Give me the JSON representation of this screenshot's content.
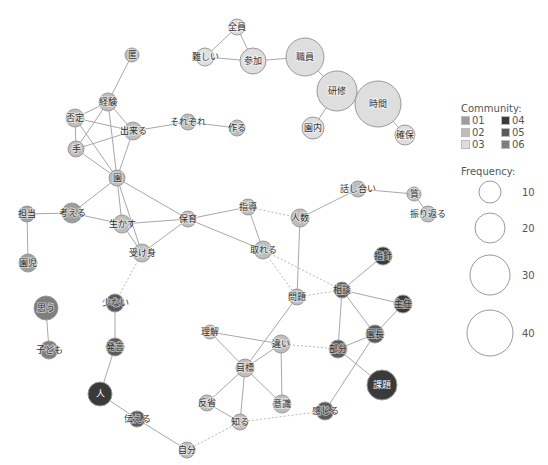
{
  "legend": {
    "community_title": "Community:",
    "communities": [
      {
        "id": "01",
        "color": "#9e9e9e"
      },
      {
        "id": "04",
        "color": "#3a3a3a"
      },
      {
        "id": "02",
        "color": "#bdbdbd"
      },
      {
        "id": "05",
        "color": "#5a5a5a"
      },
      {
        "id": "03",
        "color": "#dedede"
      },
      {
        "id": "06",
        "color": "#7e7e7e"
      }
    ],
    "frequency_title": "Frequency:",
    "frequencies": [
      {
        "label": "10",
        "r": 11,
        "cy": 192
      },
      {
        "label": "20",
        "r": 15,
        "cy": 228
      },
      {
        "label": "30",
        "r": 20,
        "cy": 275
      },
      {
        "label": "40",
        "r": 23,
        "cy": 333
      }
    ]
  },
  "community_colors": {
    "01": "#9e9e9e",
    "02": "#bdbdbd",
    "03": "#dedede",
    "04": "#3a3a3a",
    "05": "#5a5a5a",
    "06": "#7e7e7e"
  },
  "nodes": [
    {
      "id": "zenin",
      "label": "全員",
      "x": 237,
      "y": 27,
      "r": 8,
      "c": "03"
    },
    {
      "id": "muzukashii",
      "label": "難しい",
      "x": 205,
      "y": 57,
      "r": 9,
      "c": "03"
    },
    {
      "id": "sanka",
      "label": "参加",
      "x": 253,
      "y": 61,
      "r": 13,
      "c": "03"
    },
    {
      "id": "shokuin",
      "label": "職員",
      "x": 305,
      "y": 57,
      "r": 19,
      "c": "03"
    },
    {
      "id": "kenshu",
      "label": "研修",
      "x": 337,
      "y": 91,
      "r": 20,
      "c": "03"
    },
    {
      "id": "jikan",
      "label": "時間",
      "x": 378,
      "y": 104,
      "r": 23,
      "c": "03"
    },
    {
      "id": "ennai",
      "label": "園内",
      "x": 313,
      "y": 128,
      "r": 11,
      "c": "03"
    },
    {
      "id": "kakuho",
      "label": "確保",
      "x": 405,
      "y": 135,
      "r": 10,
      "c": "03"
    },
    {
      "id": "toku",
      "label": "匿",
      "x": 132,
      "y": 55,
      "r": 7,
      "c": "02"
    },
    {
      "id": "keiken",
      "label": "経験",
      "x": 108,
      "y": 102,
      "r": 9,
      "c": "02"
    },
    {
      "id": "hitei",
      "label": "否定",
      "x": 75,
      "y": 118,
      "r": 9,
      "c": "02"
    },
    {
      "id": "dekiru",
      "label": "出来る",
      "x": 133,
      "y": 131,
      "r": 9,
      "c": "02"
    },
    {
      "id": "sorezore",
      "label": "それぞれ",
      "x": 188,
      "y": 122,
      "r": 8,
      "c": "02"
    },
    {
      "id": "tsukuru",
      "label": "作る",
      "x": 237,
      "y": 128,
      "r": 8,
      "c": "02"
    },
    {
      "id": "te",
      "label": "手",
      "x": 76,
      "y": 149,
      "r": 8,
      "c": "02"
    },
    {
      "id": "en",
      "label": "園",
      "x": 117,
      "y": 178,
      "r": 8,
      "c": "02"
    },
    {
      "id": "tanto",
      "label": "担当",
      "x": 27,
      "y": 214,
      "r": 8,
      "c": "01"
    },
    {
      "id": "kangaeru",
      "label": "考える",
      "x": 72,
      "y": 213,
      "r": 10,
      "c": "01"
    },
    {
      "id": "enji",
      "label": "園児",
      "x": 28,
      "y": 263,
      "r": 9,
      "c": "01"
    },
    {
      "id": "ikasu",
      "label": "生かす",
      "x": 122,
      "y": 224,
      "r": 9,
      "c": "02"
    },
    {
      "id": "hoiku",
      "label": "保育",
      "x": 188,
      "y": 219,
      "r": 8,
      "c": "02"
    },
    {
      "id": "ukemi",
      "label": "受け身",
      "x": 142,
      "y": 253,
      "r": 9,
      "c": "02"
    },
    {
      "id": "shido",
      "label": "指導",
      "x": 248,
      "y": 207,
      "r": 8,
      "c": "02"
    },
    {
      "id": "toreru",
      "label": "取れる",
      "x": 263,
      "y": 250,
      "r": 9,
      "c": "02"
    },
    {
      "id": "ninzu",
      "label": "人数",
      "x": 300,
      "y": 218,
      "r": 9,
      "c": "02"
    },
    {
      "id": "hanashiai",
      "label": "話し合い",
      "x": 358,
      "y": 189,
      "r": 8,
      "c": "02"
    },
    {
      "id": "shitsu",
      "label": "質",
      "x": 414,
      "y": 194,
      "r": 7,
      "c": "02"
    },
    {
      "id": "furikaeru",
      "label": "振り返る",
      "x": 428,
      "y": 214,
      "r": 8,
      "c": "02"
    },
    {
      "id": "shishin",
      "label": "指針",
      "x": 383,
      "y": 256,
      "r": 9,
      "c": "04"
    },
    {
      "id": "sodan",
      "label": "相談",
      "x": 342,
      "y": 290,
      "r": 8,
      "c": "05"
    },
    {
      "id": "shunin",
      "label": "主任",
      "x": 403,
      "y": 304,
      "r": 9,
      "c": "04"
    },
    {
      "id": "encho",
      "label": "園長",
      "x": 375,
      "y": 334,
      "r": 9,
      "c": "05"
    },
    {
      "id": "bubun",
      "label": "部分",
      "x": 338,
      "y": 349,
      "r": 9,
      "c": "05"
    },
    {
      "id": "kadai",
      "label": "課題",
      "x": 382,
      "y": 385,
      "r": 15,
      "c": "04"
    },
    {
      "id": "mondai",
      "label": "問題",
      "x": 297,
      "y": 297,
      "r": 8,
      "c": "02"
    },
    {
      "id": "rikai",
      "label": "理解",
      "x": 210,
      "y": 332,
      "r": 7,
      "c": "02"
    },
    {
      "id": "chigai",
      "label": "違い",
      "x": 281,
      "y": 344,
      "r": 9,
      "c": "02"
    },
    {
      "id": "mokuhyo",
      "label": "目標",
      "x": 245,
      "y": 368,
      "r": 9,
      "c": "02"
    },
    {
      "id": "hansei",
      "label": "反省",
      "x": 207,
      "y": 403,
      "r": 8,
      "c": "02"
    },
    {
      "id": "ishiki",
      "label": "意識",
      "x": 282,
      "y": 404,
      "r": 9,
      "c": "02"
    },
    {
      "id": "shiru",
      "label": "知る",
      "x": 240,
      "y": 422,
      "r": 8,
      "c": "02"
    },
    {
      "id": "kanjiru",
      "label": "感じる",
      "x": 325,
      "y": 411,
      "r": 9,
      "c": "05"
    },
    {
      "id": "jibun",
      "label": "自分",
      "x": 187,
      "y": 450,
      "r": 8,
      "c": "02"
    },
    {
      "id": "omou",
      "label": "思う",
      "x": 46,
      "y": 308,
      "r": 12,
      "c": "06"
    },
    {
      "id": "kodomo",
      "label": "子ども",
      "x": 49,
      "y": 350,
      "r": 9,
      "c": "06"
    },
    {
      "id": "sukunai",
      "label": "少ない",
      "x": 115,
      "y": 303,
      "r": 9,
      "c": "05"
    },
    {
      "id": "hatsugen",
      "label": "発言",
      "x": 115,
      "y": 347,
      "r": 9,
      "c": "05"
    },
    {
      "id": "hito",
      "label": "人",
      "x": 100,
      "y": 394,
      "r": 12,
      "c": "04"
    },
    {
      "id": "tsutaeru",
      "label": "伝える",
      "x": 137,
      "y": 419,
      "r": 8,
      "c": "05"
    }
  ],
  "edges": [
    [
      "zenin",
      "muzukashii"
    ],
    [
      "zenin",
      "sanka"
    ],
    [
      "muzukashii",
      "sanka"
    ],
    [
      "sanka",
      "shokuin"
    ],
    [
      "shokuin",
      "kenshu"
    ],
    [
      "kenshu",
      "jikan"
    ],
    [
      "kenshu",
      "ennai"
    ],
    [
      "jikan",
      "kakuho"
    ],
    [
      "toku",
      "keiken"
    ],
    [
      "keiken",
      "hitei"
    ],
    [
      "keiken",
      "dekiru"
    ],
    [
      "keiken",
      "te"
    ],
    [
      "keiken",
      "en"
    ],
    [
      "hitei",
      "dekiru"
    ],
    [
      "hitei",
      "te"
    ],
    [
      "hitei",
      "en"
    ],
    [
      "te",
      "dekiru"
    ],
    [
      "te",
      "en"
    ],
    [
      "dekiru",
      "en"
    ],
    [
      "dekiru",
      "sorezore"
    ],
    [
      "sorezore",
      "tsukuru"
    ],
    [
      "en",
      "kangaeru"
    ],
    [
      "en",
      "ikasu"
    ],
    [
      "en",
      "hoiku"
    ],
    [
      "en",
      "ukemi"
    ],
    [
      "kangaeru",
      "tanto"
    ],
    [
      "tanto",
      "enji"
    ],
    [
      "kangaeru",
      "ikasu"
    ],
    [
      "ikasu",
      "hoiku"
    ],
    [
      "ikasu",
      "ukemi"
    ],
    [
      "hoiku",
      "ukemi"
    ],
    [
      "hoiku",
      "shido"
    ],
    [
      "hoiku",
      "toreru"
    ],
    [
      "shido",
      "toreru"
    ],
    [
      "shido",
      "ninzu",
      "dashed"
    ],
    [
      "ninzu",
      "hanashiai"
    ],
    [
      "hanashiai",
      "shitsu"
    ],
    [
      "shitsu",
      "furikaeru"
    ],
    [
      "ninzu",
      "mondai"
    ],
    [
      "toreru",
      "mondai",
      "dashed"
    ],
    [
      "toreru",
      "sodan",
      "dashed"
    ],
    [
      "mondai",
      "sodan",
      "dashed"
    ],
    [
      "ukemi",
      "sukunai",
      "dashed"
    ],
    [
      "sukunai",
      "hatsugen"
    ],
    [
      "hatsugen",
      "hito"
    ],
    [
      "hito",
      "tsutaeru"
    ],
    [
      "tsutaeru",
      "jibun"
    ],
    [
      "jibun",
      "shiru",
      "dashed"
    ],
    [
      "shiru",
      "kanjiru",
      "dashed"
    ],
    [
      "shishin",
      "sodan"
    ],
    [
      "sodan",
      "shunin"
    ],
    [
      "sodan",
      "bubun"
    ],
    [
      "sodan",
      "encho"
    ],
    [
      "shunin",
      "encho"
    ],
    [
      "encho",
      "bubun"
    ],
    [
      "bubun",
      "kadai"
    ],
    [
      "encho",
      "kanjiru"
    ],
    [
      "chigai",
      "bubun",
      "dashed"
    ],
    [
      "mondai",
      "mokuhyo"
    ],
    [
      "rikai",
      "mokuhyo"
    ],
    [
      "rikai",
      "chigai"
    ],
    [
      "chigai",
      "mokuhyo"
    ],
    [
      "chigai",
      "ishiki"
    ],
    [
      "mokuhyo",
      "hansei"
    ],
    [
      "mokuhyo",
      "shiru"
    ],
    [
      "mokuhyo",
      "ishiki"
    ],
    [
      "hansei",
      "shiru"
    ],
    [
      "omou",
      "kodomo"
    ]
  ]
}
